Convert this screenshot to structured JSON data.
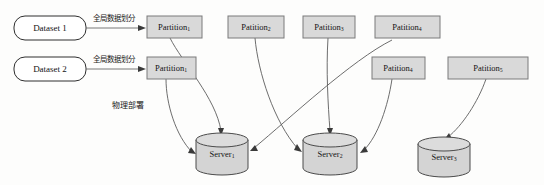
{
  "diagram": {
    "background_color": "#fdfdfc",
    "box_fill": "#d9d9d9",
    "box_stroke": "#7a7a7a",
    "dataset_fill": "#ffffff",
    "dataset_stroke": "#2e2e2e",
    "cylinder_fill": "#d4d4d4",
    "cylinder_stroke": "#4a4a4a",
    "connector_color": "#5c5c5c",
    "datasets": [
      {
        "id": "dataset-1",
        "label": "Dataset 1"
      },
      {
        "id": "dataset-2",
        "label": "Dataset 2"
      }
    ],
    "edge_labels": [
      {
        "id": "partition-label-1",
        "text": "全局数据划分"
      },
      {
        "id": "partition-label-2",
        "text": "全局数据划分"
      },
      {
        "id": "deployment-label",
        "text": "物理部署"
      }
    ],
    "partitions_row_top": [
      {
        "id": "partition-1-top",
        "name": "Partition",
        "index": "1"
      },
      {
        "id": "patition-2",
        "name": "Patition",
        "index": "2"
      },
      {
        "id": "patition-3",
        "name": "Patition",
        "index": "3"
      },
      {
        "id": "patition-4-top",
        "name": "Patition",
        "index": "4"
      }
    ],
    "partitions_row_bottom": [
      {
        "id": "partition-1-bottom",
        "name": "Partition",
        "index": "1"
      },
      {
        "id": "patition-4-bottom",
        "name": "Patition",
        "index": "4"
      },
      {
        "id": "patition-5",
        "name": "Patition",
        "index": "5"
      }
    ],
    "servers": [
      {
        "id": "server-1",
        "name": "Server",
        "index": "1"
      },
      {
        "id": "server-2",
        "name": "Server",
        "index": "2"
      },
      {
        "id": "server-3",
        "name": "Server",
        "index": "3"
      }
    ]
  }
}
